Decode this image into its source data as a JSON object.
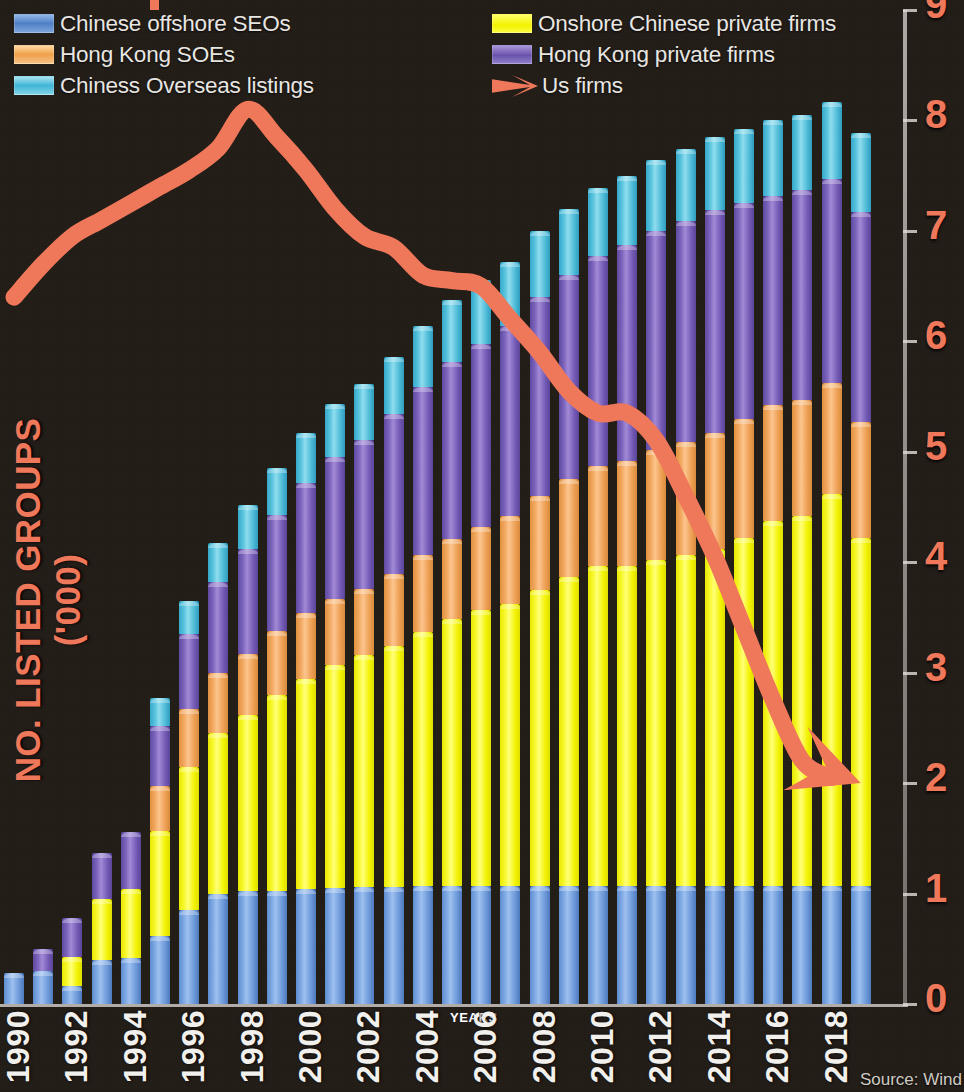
{
  "legend": {
    "left_column": [
      {
        "label": "Chinese offshore SEOs",
        "swatch": "blue",
        "color": "#6a9bdc"
      },
      {
        "label": "Hong Kong SOEs",
        "swatch": "orange",
        "color": "#f0a858"
      },
      {
        "label": "Chiness Overseas listings",
        "swatch": "cyan",
        "color": "#62c8e0"
      }
    ],
    "right_column": [
      {
        "label": "Onshore Chinese private firms",
        "swatch": "yellow",
        "color": "#f5f520"
      },
      {
        "label": "Hong Kong private firms",
        "swatch": "purple",
        "color": "#7b62b8"
      },
      {
        "label": "Us firms",
        "swatch": "arrow",
        "color": "#f0785a"
      }
    ]
  },
  "axes": {
    "y_title": "NO. LISTED GROUPS ('000)",
    "x_title": "YEARS",
    "y_ticks": [
      "0",
      "1",
      "2",
      "3",
      "4",
      "5",
      "6",
      "7",
      "8",
      "9"
    ],
    "x_ticks": [
      "1990",
      "1992",
      "1994",
      "1996",
      "1998",
      "2000",
      "2002",
      "2004",
      "2006",
      "2008",
      "2010",
      "2012",
      "2014",
      "2016",
      "2018"
    ]
  },
  "source": "Source: Wind",
  "chart_data": {
    "type": "bar",
    "title": "",
    "subtitle": "",
    "xlabel": "YEARS",
    "ylabel": "NO. LISTED GROUPS ('000)",
    "ylim": [
      0,
      9
    ],
    "xlim": [
      1990,
      2019
    ],
    "grid": false,
    "stacked": true,
    "legend_position": "top",
    "categories": [
      1990,
      1991,
      1992,
      1993,
      1994,
      1995,
      1996,
      1997,
      1998,
      1999,
      2000,
      2001,
      2002,
      2003,
      2004,
      2005,
      2006,
      2007,
      2008,
      2009,
      2010,
      2011,
      2012,
      2013,
      2014,
      2015,
      2016,
      2017,
      2018,
      2019
    ],
    "series": [
      {
        "name": "Chinese offshore SEOs",
        "color": "#6a9bdc",
        "values": [
          0.28,
          0.3,
          0.16,
          0.4,
          0.42,
          0.62,
          0.85,
          1.0,
          1.02,
          1.02,
          1.04,
          1.05,
          1.06,
          1.06,
          1.07,
          1.07,
          1.07,
          1.07,
          1.07,
          1.07,
          1.07,
          1.07,
          1.07,
          1.07,
          1.07,
          1.07,
          1.07,
          1.07,
          1.07,
          1.07
        ]
      },
      {
        "name": "Onshore Chinese private firms",
        "color": "#f5f520",
        "values": [
          0.0,
          0.0,
          0.27,
          0.55,
          0.62,
          0.95,
          1.3,
          1.45,
          1.6,
          1.78,
          1.9,
          2.02,
          2.1,
          2.18,
          2.3,
          2.42,
          2.5,
          2.55,
          2.68,
          2.8,
          2.9,
          2.9,
          2.95,
          3.0,
          3.05,
          3.15,
          3.3,
          3.35,
          3.55,
          3.15
        ]
      },
      {
        "name": "Hong Kong SOEs",
        "color": "#f0a858",
        "values": [
          0.0,
          0.0,
          0.0,
          0.0,
          0.0,
          0.4,
          0.52,
          0.55,
          0.55,
          0.58,
          0.6,
          0.6,
          0.6,
          0.65,
          0.7,
          0.72,
          0.75,
          0.8,
          0.85,
          0.88,
          0.9,
          0.95,
          1.0,
          1.02,
          1.05,
          1.08,
          1.05,
          1.05,
          1.0,
          1.05
        ]
      },
      {
        "name": "Hong Kong private firms",
        "color": "#7b62b8",
        "values": [
          0.0,
          0.2,
          0.35,
          0.42,
          0.52,
          0.55,
          0.68,
          0.82,
          0.95,
          1.05,
          1.18,
          1.28,
          1.35,
          1.45,
          1.52,
          1.6,
          1.66,
          1.72,
          1.8,
          1.85,
          1.9,
          1.95,
          1.98,
          2.0,
          2.02,
          1.95,
          1.9,
          1.9,
          1.85,
          1.9
        ]
      },
      {
        "name": "Chiness Overseas listings",
        "color": "#62c8e0",
        "values": [
          0.0,
          0.0,
          0.0,
          0.0,
          0.0,
          0.25,
          0.3,
          0.35,
          0.4,
          0.42,
          0.45,
          0.48,
          0.5,
          0.52,
          0.55,
          0.56,
          0.58,
          0.58,
          0.6,
          0.6,
          0.62,
          0.63,
          0.64,
          0.65,
          0.66,
          0.67,
          0.68,
          0.68,
          0.7,
          0.72
        ]
      }
    ],
    "overlay_line": {
      "name": "Us firms",
      "color": "#f0785a",
      "marker": "arrow",
      "x": [
        1990,
        1991,
        1992,
        1993,
        1994,
        1995,
        1996,
        1997,
        1998,
        1999,
        2000,
        2001,
        2002,
        2003,
        2004,
        2005,
        2006,
        2007,
        2008,
        2009,
        2010,
        2011,
        2012,
        2013,
        2014,
        2015,
        2016,
        2017,
        2018,
        2019
      ],
      "values": [
        6.4,
        6.7,
        6.95,
        7.1,
        7.25,
        7.4,
        7.55,
        7.75,
        8.1,
        7.85,
        7.55,
        7.2,
        6.95,
        6.85,
        6.6,
        6.55,
        6.5,
        6.2,
        5.9,
        5.55,
        5.35,
        5.35,
        5.1,
        4.6,
        4.05,
        3.4,
        2.75,
        2.2,
        2.05,
        2.0
      ]
    }
  }
}
